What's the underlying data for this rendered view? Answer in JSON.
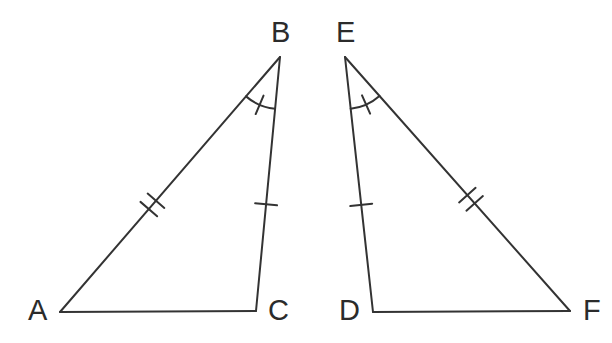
{
  "figure": {
    "background_color": "#ffffff",
    "stroke_color": "#333333",
    "label_color": "#2b2b2b",
    "stroke_width": 2,
    "width": 612,
    "height": 343
  },
  "triangles": [
    {
      "name": "triangle-abc",
      "vertices": [
        {
          "label": "A",
          "x": 60,
          "y": 312,
          "label_x": 28,
          "label_y": 296
        },
        {
          "label": "B",
          "x": 280,
          "y": 57,
          "label_x": 271,
          "label_y": 18
        },
        {
          "label": "C",
          "x": 256,
          "y": 311,
          "label_x": 268,
          "label_y": 296
        }
      ],
      "sides": [
        {
          "name": "side-ab",
          "from": "A",
          "to": "B",
          "tick_count": 2,
          "tick_position": 0.42
        },
        {
          "name": "side-bc",
          "from": "B",
          "to": "C",
          "tick_count": 1,
          "tick_position": 0.58
        },
        {
          "name": "side-ca",
          "from": "C",
          "to": "A",
          "tick_count": 0,
          "tick_position": 0.5
        }
      ],
      "angle_marks": [
        {
          "name": "angle-b",
          "vertex": "B",
          "arm1": "A",
          "arm2": "C",
          "radius": 52,
          "arc_tick_count": 1
        }
      ]
    },
    {
      "name": "triangle-def",
      "vertices": [
        {
          "label": "D",
          "x": 373,
          "y": 312,
          "label_x": 339,
          "label_y": 296
        },
        {
          "label": "E",
          "x": 345,
          "y": 57,
          "label_x": 336,
          "label_y": 18
        },
        {
          "label": "F",
          "x": 570,
          "y": 311,
          "label_x": 583,
          "label_y": 296
        }
      ],
      "sides": [
        {
          "name": "side-de",
          "from": "D",
          "to": "E",
          "tick_count": 1,
          "tick_position": 0.42
        },
        {
          "name": "side-ef",
          "from": "E",
          "to": "F",
          "tick_count": 2,
          "tick_position": 0.56
        },
        {
          "name": "side-fd",
          "from": "F",
          "to": "D",
          "tick_count": 0,
          "tick_position": 0.5
        }
      ],
      "angle_marks": [
        {
          "name": "angle-e",
          "vertex": "E",
          "arm1": "F",
          "arm2": "D",
          "radius": 52,
          "arc_tick_count": 1
        }
      ]
    }
  ],
  "tick_style": {
    "length": 22,
    "spacing": 11,
    "arc_tick_length": 20
  }
}
